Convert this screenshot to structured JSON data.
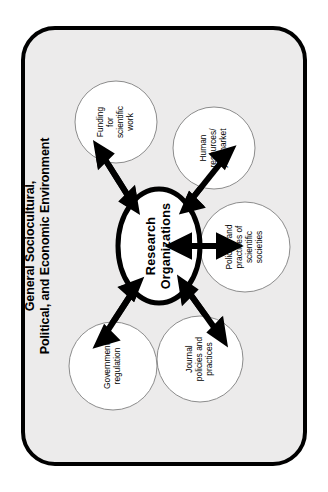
{
  "diagram": {
    "title_lines": [
      "General Sociocultural,",
      "Political, and Economic Environment"
    ],
    "core": {
      "name": "research-organizations",
      "lines": [
        "Research",
        "Organizations"
      ]
    },
    "satellites": [
      {
        "name": "funding-for-scientific-work",
        "lines": [
          "Funding",
          "for",
          "scientific",
          "work"
        ],
        "position": "top-left"
      },
      {
        "name": "human-resources-job-market",
        "lines": [
          "Human",
          "resources/",
          "job market"
        ],
        "position": "top-right"
      },
      {
        "name": "policies-and-practices-of-scientific-societies",
        "lines": [
          "Policies and",
          "practices of",
          "scientific",
          "societies"
        ],
        "position": "right"
      },
      {
        "name": "journal-policies-and-practices",
        "lines": [
          "Journal",
          "policies and",
          "practices"
        ],
        "position": "bottom-right"
      },
      {
        "name": "government-regulation",
        "lines": [
          "Government",
          "regulation"
        ],
        "position": "bottom-left"
      }
    ],
    "connectors": [
      {
        "name": "connector-core-to-funding",
        "style": "double-headed-arrow"
      },
      {
        "name": "connector-core-to-human-resources",
        "style": "double-headed-arrow"
      },
      {
        "name": "connector-core-to-scientific-societies",
        "style": "double-headed-arrow"
      },
      {
        "name": "connector-core-to-journal-policies",
        "style": "double-headed-arrow"
      },
      {
        "name": "connector-core-to-government-regulation",
        "style": "double-headed-arrow"
      }
    ],
    "colors": {
      "frame_border": "#000000",
      "frame_fill": "#ecebeb",
      "node_fill": "#ffffff",
      "node_stroke": "#8c8c8c",
      "core_stroke": "#000000",
      "arrow": "#000000",
      "text": "#000000",
      "page_background": "#ffffff"
    }
  }
}
